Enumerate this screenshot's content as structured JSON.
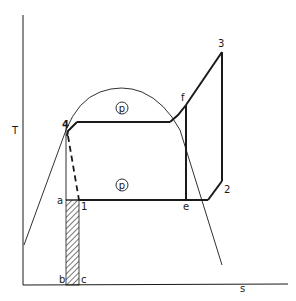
{
  "diagram": {
    "type": "T-s diagram (refrigeration/heat pump cycle)",
    "axes": {
      "y_label": "T",
      "x_label": "s"
    },
    "points": {
      "p1": "1",
      "p2": "2",
      "p3": "3",
      "p4": "4",
      "a": "a",
      "b": "b",
      "c": "c",
      "e": "e",
      "f": "f"
    },
    "pressure_markers": {
      "upper": "p",
      "lower": "p"
    },
    "colors": {
      "line": "#1a1a1a",
      "background": "#ffffff"
    }
  }
}
